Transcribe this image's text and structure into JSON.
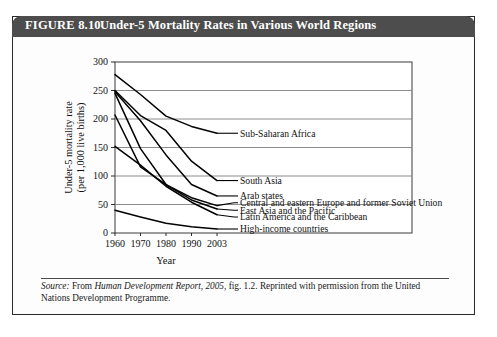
{
  "figure": {
    "label": "FIGURE 8.10",
    "title": "Under-5 Mortality Rates in Various World Regions",
    "title_bar_color": "#4d4d4d",
    "title_text_color": "#ffffff",
    "border_color": "#2a2a2a"
  },
  "source": {
    "prefix": "Source:",
    "text_part1": " From ",
    "report_title": "Human Development Report, 2005",
    "text_part2": ", fig. 1.2. Reprinted with permission from the United Nations Development Programme."
  },
  "chart_data": {
    "type": "line",
    "title": "Under-5 Mortality Rates in Various World Regions",
    "xlabel": "Year",
    "ylabel": "Under-5 mortality rate (per 1,000 live births)",
    "ylabel_line1": "Under-5 mortality rate",
    "ylabel_line2": "(per 1,000 live births)",
    "x": [
      1960,
      1970,
      1980,
      1990,
      2003
    ],
    "xtick_labels": [
      "1960",
      "1970",
      "1980",
      "1990",
      "2003"
    ],
    "ytick_labels": [
      "0",
      "50",
      "100",
      "150",
      "200",
      "250",
      "300"
    ],
    "yticks": [
      0,
      50,
      100,
      150,
      200,
      250,
      300
    ],
    "ylim": [
      0,
      300
    ],
    "xlim": [
      1960,
      2003
    ],
    "grid": "horizontal",
    "legend": "inline-right-labels",
    "line_color": "#000000",
    "series": [
      {
        "name": "Sub-Saharan Africa",
        "values": [
          278,
          243,
          205,
          187,
          175
        ],
        "label_y": 175
      },
      {
        "name": "South Asia",
        "values": [
          250,
          206,
          180,
          126,
          92
        ],
        "label_y": 92
      },
      {
        "name": "Arab states",
        "values": [
          248,
          197,
          137,
          85,
          65
        ],
        "label_y": 65
      },
      {
        "name": "Central and eastern Europe and former Soviet Union",
        "values": [
          207,
          116,
          85,
          62,
          48
        ],
        "label_y": 53
      },
      {
        "name": "East Asia and the Pacific",
        "values": [
          245,
          148,
          85,
          58,
          42
        ],
        "label_y": 40
      },
      {
        "name": "Latin America and the Caribbean",
        "values": [
          152,
          119,
          82,
          54,
          32
        ],
        "label_y": 28
      },
      {
        "name": "High-income countries",
        "values": [
          40,
          28,
          17,
          11,
          7
        ],
        "label_y": 7
      }
    ]
  }
}
